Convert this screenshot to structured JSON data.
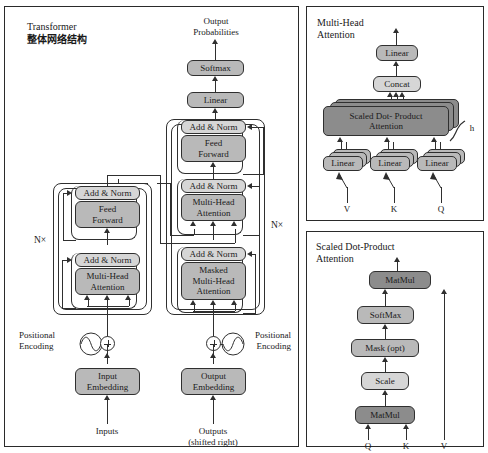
{
  "diagram": {
    "title_en": "Transformer",
    "title_cn": "整体网络结构"
  },
  "main_panel": {
    "top_label": "Output\nProbabilities",
    "softmax": "Softmax",
    "linear": "Linear",
    "decoder": {
      "add_norm_top": "Add & Norm",
      "feed_forward": "Feed\nForward",
      "add_norm_mid": "Add & Norm",
      "multi_head_attention": "Multi-Head\nAttention",
      "add_norm_bottom": "Add & Norm",
      "masked_attention": "Masked\nMulti-Head\nAttention",
      "nx": "N×"
    },
    "encoder": {
      "add_norm_top": "Add & Norm",
      "feed_forward": "Feed\nForward",
      "add_norm_bottom": "Add & Norm",
      "multi_head_attention": "Multi-Head\nAttention",
      "nx": "N×"
    },
    "positional_encoding_left": "Positional\nEncoding",
    "positional_encoding_right": "Positional\nEncoding",
    "input_embedding": "Input\nEmbedding",
    "output_embedding": "Output\nEmbedding",
    "inputs_label": "Inputs",
    "outputs_label": "Outputs\n(shifted right)"
  },
  "mha_panel": {
    "title": "Multi-Head\nAttention",
    "linear_top": "Linear",
    "concat": "Concat",
    "scaled_dot_product": "Scaled Dot- Product\nAttention",
    "heads_label": "h",
    "linear_v": "Linear",
    "linear_k": "Linear",
    "linear_q": "Linear",
    "input_v": "V",
    "input_k": "K",
    "input_q": "Q"
  },
  "sdpa_panel": {
    "title": "Scaled Dot-Product\nAttention",
    "matmul_top": "MatMul",
    "softmax": "SoftMax",
    "mask": "Mask (opt)",
    "scale": "Scale",
    "matmul_bottom": "MatMul",
    "input_q": "Q",
    "input_k": "K",
    "input_v": "V"
  },
  "colors": {
    "block_gray": "#b9b9b9",
    "block_dark": "#8c8c8c",
    "block_light": "#d6d6d6",
    "stroke": "#2f2f2f",
    "background": "#ffffff"
  }
}
